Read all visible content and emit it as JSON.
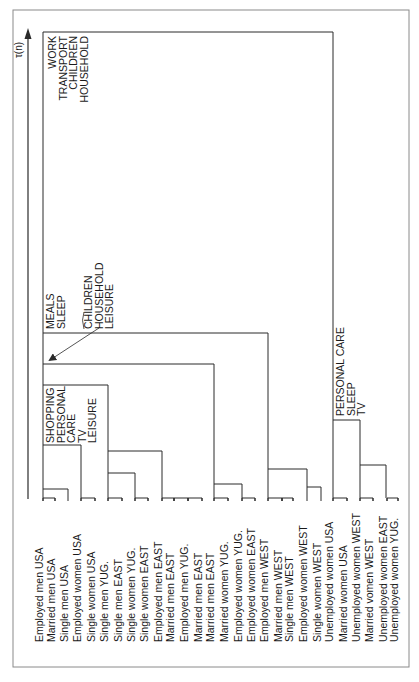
{
  "figure": {
    "frame_color": "#8a8a8a",
    "line_color": "#2a2a2a",
    "axis_label": "τ(n)"
  },
  "chart_data": {
    "type": "dendrogram",
    "title": "",
    "ylabel": "τ(n)",
    "orientation": "rotated (leaves at bottom, axis arrow points up)",
    "leaves": [
      "Employed men USA",
      "Married men USA",
      "Single men USA",
      "Employed women USA",
      "Single women USA",
      "Single men YUG.",
      "Single men EAST",
      "Single women YUG.",
      "Single women EAST",
      "Employed men EAST",
      "Married men EAST",
      "Employed men YUG.",
      "Married men EAST",
      "Married men EAST",
      "Married women YUG.",
      "Employed women YUG.",
      "Employed women EAST",
      "Employed men WEST",
      "Married men WEST",
      "Single men WEST",
      "Employed women WEST",
      "Single women WEST",
      "Unemployed women USA",
      "Married women USA",
      "Unemployed women WEST",
      "Married vomen WEST",
      "Unemployed women EAST",
      "Unemployed women YUG."
    ],
    "leaf_x": [
      43,
      55,
      68,
      81,
      95,
      108,
      122,
      135,
      148,
      162,
      174,
      188,
      202,
      214,
      228,
      242,
      255,
      268,
      282,
      293,
      307,
      321,
      333,
      347,
      360,
      373,
      387,
      398
    ],
    "leaf_caps": [
      {
        "x1": 43,
        "x2": 55
      },
      {
        "x1": 81,
        "x2": 95
      },
      {
        "x1": 108,
        "x2": 122
      },
      {
        "x1": 135,
        "x2": 148
      },
      {
        "x1": 162,
        "x2": 174
      },
      {
        "x1": 174,
        "x2": 188
      },
      {
        "x1": 188,
        "x2": 202
      },
      {
        "x1": 214,
        "x2": 228
      },
      {
        "x1": 242,
        "x2": 255
      },
      {
        "x1": 268,
        "x2": 282
      },
      {
        "x1": 282,
        "x2": 293
      },
      {
        "x1": 321,
        "x2": 321
      },
      {
        "x1": 333,
        "x2": 347
      },
      {
        "x1": 360,
        "x2": 373
      },
      {
        "x1": 387,
        "x2": 398
      }
    ],
    "merges": [
      {
        "x1": 43,
        "x2": 68,
        "y": 489
      },
      {
        "x1": 43,
        "x2": 81,
        "y": 445
      },
      {
        "x1": 108,
        "x2": 135,
        "y": 473
      },
      {
        "x1": 108,
        "x2": 162,
        "y": 451
      },
      {
        "x1": 43,
        "x2": 108,
        "y": 385
      },
      {
        "x1": 214,
        "x2": 242,
        "y": 484
      },
      {
        "x1": 43,
        "x2": 214,
        "y": 364
      },
      {
        "x1": 307,
        "x2": 321,
        "y": 487
      },
      {
        "x1": 268,
        "x2": 307,
        "y": 469
      },
      {
        "x1": 43,
        "x2": 268,
        "y": 333
      },
      {
        "x1": 360,
        "x2": 386,
        "y": 465
      },
      {
        "x1": 333,
        "x2": 360,
        "y": 420
      },
      {
        "x1": 43,
        "x2": 333,
        "y": 32
      }
    ],
    "leaf_baseline_y": 498,
    "annotations": [
      {
        "id": "root",
        "lines": [
          "WORK",
          "TRANSPORT",
          "CHILDREN",
          "HOUSEHOLD"
        ],
        "x": 48,
        "y": 100,
        "align": "end-top"
      },
      {
        "id": "meals",
        "lines": [
          "MEALS",
          "SLEEP"
        ],
        "x": 46,
        "y": 329
      },
      {
        "id": "children",
        "lines": [
          "CHILDREN",
          "HOUSEHOLD",
          "LEISURE"
        ],
        "x": 84,
        "y": 329
      },
      {
        "id": "shopping",
        "lines": [
          "SHOPPING",
          "PERSONAL",
          "CARE",
          "TV",
          "LEISURE"
        ],
        "x": 46,
        "y": 443
      },
      {
        "id": "personal_care",
        "lines": [
          "PERSONAL CARE",
          "SLEEP",
          "TV"
        ],
        "x": 336,
        "y": 416
      }
    ]
  },
  "labels": {
    "root_annotation": [
      "WORK",
      "TRANSPORT",
      "CHILDREN",
      "HOUSEHOLD"
    ],
    "meals_annotation": [
      "MEALS",
      "SLEEP"
    ],
    "children_annotation": [
      "CHILDREN",
      "HOUSEHOLD",
      "LEISURE"
    ],
    "shopping_annotation": [
      "SHOPPING",
      "PERSONAL",
      "CARE",
      "TV",
      "LEISURE"
    ],
    "personal_care_annotation": [
      "PERSONAL CARE",
      "SLEEP",
      "TV"
    ]
  }
}
